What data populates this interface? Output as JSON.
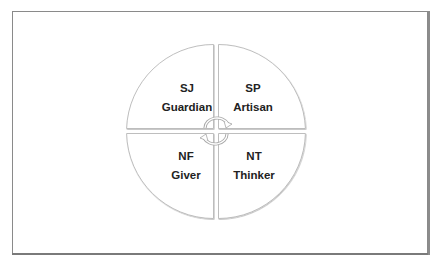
{
  "diagram": {
    "type": "four-quadrant-cycle",
    "center_icon": "circular-arrows-icon",
    "quadrants": [
      {
        "position": "top-left",
        "code": "SJ",
        "name": "Guardian"
      },
      {
        "position": "top-right",
        "code": "SP",
        "name": "Artisan"
      },
      {
        "position": "bottom-left",
        "code": "NF",
        "name": "Giver"
      },
      {
        "position": "bottom-right",
        "code": "NT",
        "name": "Thinker"
      }
    ]
  },
  "colors": {
    "frame_border": "#8a8a8a",
    "quadrant_fill": "#ffffff",
    "quadrant_stroke": "#b5b5b5",
    "text": "#222222"
  }
}
